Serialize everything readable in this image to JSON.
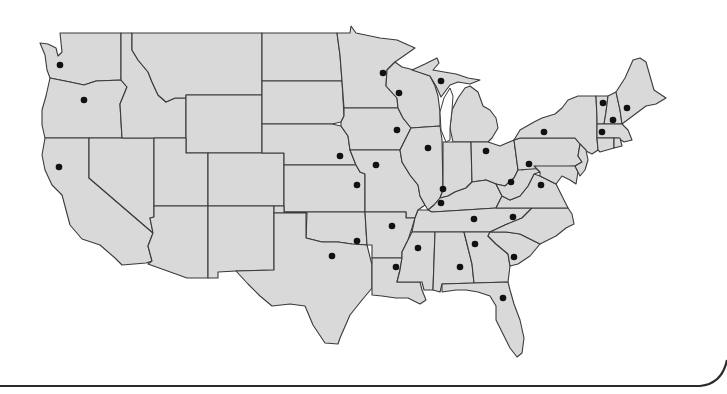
{
  "map": {
    "type": "choropleth-outline",
    "region": "Contiguous United States",
    "fill_color": "#d9d9d9",
    "border_color": "#3a3a3a",
    "marker_color": "#111111",
    "background": "#ffffff"
  },
  "markers": [
    {
      "state": "Washington",
      "x": 60,
      "y": 65
    },
    {
      "state": "Oregon",
      "x": 84,
      "y": 100
    },
    {
      "state": "California",
      "x": 59,
      "y": 167
    },
    {
      "state": "Nebraska",
      "x": 340,
      "y": 156
    },
    {
      "state": "Kansas",
      "x": 357,
      "y": 185
    },
    {
      "state": "Missouri",
      "x": 376,
      "y": 165
    },
    {
      "state": "Oklahoma",
      "x": 357,
      "y": 241
    },
    {
      "state": "Texas",
      "x": 332,
      "y": 256
    },
    {
      "state": "Minnesota",
      "x": 383,
      "y": 73
    },
    {
      "state": "Wisconsin",
      "x": 399,
      "y": 93
    },
    {
      "state": "Michigan",
      "x": 441,
      "y": 81
    },
    {
      "state": "Iowa",
      "x": 397,
      "y": 130
    },
    {
      "state": "Illinois",
      "x": 428,
      "y": 148
    },
    {
      "state": "Indiana",
      "x": 443,
      "y": 189
    },
    {
      "state": "Kentucky",
      "x": 441,
      "y": 203
    },
    {
      "state": "Ohio",
      "x": 486,
      "y": 151
    },
    {
      "state": "Pennsylvania",
      "x": 529,
      "y": 164
    },
    {
      "state": "New York",
      "x": 544,
      "y": 132
    },
    {
      "state": "West Virginia",
      "x": 511,
      "y": 182
    },
    {
      "state": "Virginia",
      "x": 541,
      "y": 185
    },
    {
      "state": "Tennessee",
      "x": 474,
      "y": 219
    },
    {
      "state": "North Carolina",
      "x": 513,
      "y": 217
    },
    {
      "state": "Arkansas",
      "x": 392,
      "y": 226
    },
    {
      "state": "Mississippi",
      "x": 418,
      "y": 248
    },
    {
      "state": "Louisiana",
      "x": 396,
      "y": 267
    },
    {
      "state": "Alabama",
      "x": 460,
      "y": 267
    },
    {
      "state": "Georgia",
      "x": 475,
      "y": 244
    },
    {
      "state": "South Carolina",
      "x": 514,
      "y": 257
    },
    {
      "state": "Florida",
      "x": 503,
      "y": 298
    },
    {
      "state": "Vermont",
      "x": 603,
      "y": 103
    },
    {
      "state": "New Hampshire",
      "x": 613,
      "y": 120
    },
    {
      "state": "Maine",
      "x": 627,
      "y": 108
    },
    {
      "state": "Massachusetts",
      "x": 602,
      "y": 132
    }
  ]
}
